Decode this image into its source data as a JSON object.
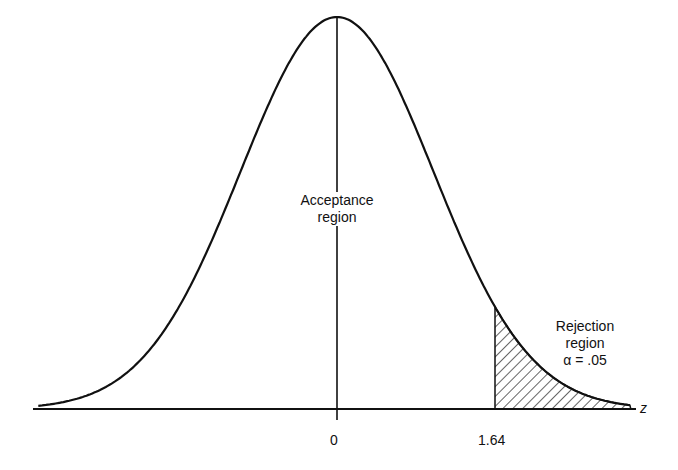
{
  "chart_data": {
    "type": "area",
    "title": "",
    "xlabel": "z",
    "ylabel": "",
    "distribution": "standard normal",
    "x_ticks": [
      {
        "value": 0,
        "label": "0"
      },
      {
        "value": 1.64,
        "label": "1.64"
      }
    ],
    "critical_value": 1.64,
    "alpha": 0.05,
    "regions": [
      {
        "name": "Acceptance region",
        "range": [
          null,
          1.64
        ]
      },
      {
        "name": "Rejection region",
        "range": [
          1.64,
          null
        ],
        "alpha": 0.05,
        "shaded": true
      }
    ],
    "grid": false,
    "legend": "none"
  },
  "labels": {
    "acceptance_line1": "Acceptance",
    "acceptance_line2": "region",
    "rejection_line1": "Rejection",
    "rejection_line2": "region",
    "alpha_text": "α = .05",
    "axis_z": "z",
    "tick_zero": "0",
    "tick_critical": "1.64"
  }
}
